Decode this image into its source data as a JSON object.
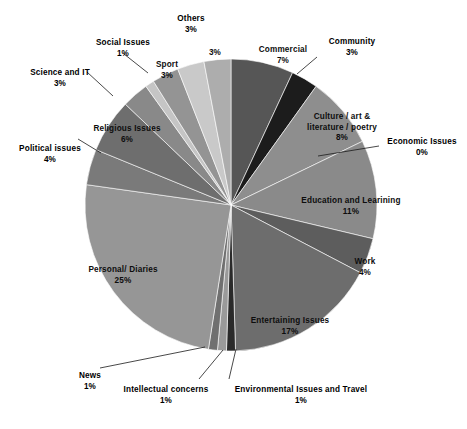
{
  "chart_data": {
    "type": "pie",
    "title": "",
    "xlabel": "",
    "ylabel": "",
    "legend_position": "none",
    "grid": false,
    "labels_show_percent": true,
    "categories": [
      "Commercial",
      "Community",
      "Culture / art & literature / poetry",
      "Economic Issues",
      "Education and Learining",
      "Work",
      "Entertaining Issues",
      "Environmental Issues and Travel",
      "Intellectual concerns",
      "News",
      "Personal/ Diaries",
      "Political issues",
      "Religious Issues",
      "Science and IT",
      "Social Issues",
      "Sport",
      "",
      "Others"
    ],
    "values": [
      7,
      3,
      8,
      0,
      11,
      4,
      17,
      1,
      1,
      1,
      25,
      4,
      6,
      3,
      1,
      3,
      3,
      3
    ],
    "unit": "%",
    "slices": [
      {
        "label": "Commercial",
        "value": 7,
        "percent": "7%",
        "color": "#565656",
        "label_x": 252,
        "label_y": 45,
        "label_w": 62,
        "placement": "inside"
      },
      {
        "label": "Community",
        "value": 3,
        "percent": "3%",
        "color": "#1c1c1c",
        "label_x": 315,
        "label_y": 37,
        "label_w": 74,
        "placement": "outside"
      },
      {
        "label": "Culture / art &\nliterature / poetry",
        "value": 8,
        "percent": "8%",
        "color": "#8e8e8e",
        "label_x": 300,
        "label_y": 112,
        "label_w": 84,
        "placement": "inside"
      },
      {
        "label": "Economic Issues",
        "value": 0,
        "percent": "0%",
        "color": "#7d7d7d",
        "label_x": 383,
        "label_y": 137,
        "label_w": 78,
        "placement": "outside"
      },
      {
        "label": "Education and Learining",
        "value": 11,
        "percent": "11%",
        "color": "#8a8a8a",
        "label_x": 296,
        "label_y": 196,
        "label_w": 110,
        "placement": "inside"
      },
      {
        "label": "Work",
        "value": 4,
        "percent": "4%",
        "color": "#5d5d5d",
        "label_x": 345,
        "label_y": 257,
        "label_w": 40,
        "placement": "inside"
      },
      {
        "label": "Entertaining Issues",
        "value": 17,
        "percent": "17%",
        "color": "#6d6d6d",
        "label_x": 244,
        "label_y": 316,
        "label_w": 92,
        "placement": "inside"
      },
      {
        "label": "Environmental Issues and Travel",
        "value": 1,
        "percent": "1%",
        "color": "#2a2a2a",
        "label_x": 226,
        "label_y": 385,
        "label_w": 150,
        "placement": "outside"
      },
      {
        "label": "Intellectual concerns",
        "value": 1,
        "percent": "1%",
        "color": "#9a9a9a",
        "label_x": 116,
        "label_y": 385,
        "label_w": 100,
        "placement": "outside"
      },
      {
        "label": "News",
        "value": 1,
        "percent": "1%",
        "color": "#707070",
        "label_x": 72,
        "label_y": 371,
        "label_w": 36,
        "placement": "outside"
      },
      {
        "label": "Personal/ Diaries",
        "value": 25,
        "percent": "25%",
        "color": "#969696",
        "label_x": 78,
        "label_y": 265,
        "label_w": 90,
        "placement": "inside"
      },
      {
        "label": "Political issues",
        "value": 4,
        "percent": "4%",
        "color": "#7a7a7a",
        "label_x": 14,
        "label_y": 144,
        "label_w": 72,
        "placement": "outside"
      },
      {
        "label": "Religious Issues",
        "value": 6,
        "percent": "6%",
        "color": "#6e6e6e",
        "label_x": 86,
        "label_y": 124,
        "label_w": 82,
        "placement": "inside"
      },
      {
        "label": "Science and IT",
        "value": 3,
        "percent": "3%",
        "color": "#898989",
        "label_x": 24,
        "label_y": 68,
        "label_w": 72,
        "placement": "outside"
      },
      {
        "label": "Social Issues",
        "value": 1,
        "percent": "1%",
        "color": "#c5c5c5",
        "label_x": 88,
        "label_y": 38,
        "label_w": 70,
        "placement": "outside"
      },
      {
        "label": "Sport",
        "value": 3,
        "percent": "3%",
        "color": "#949494",
        "label_x": 148,
        "label_y": 60,
        "label_w": 38,
        "placement": "inside"
      },
      {
        "label": "",
        "value": 3,
        "percent": "3%",
        "color": "#c9c9c9",
        "label_x": 197,
        "label_y": 48,
        "label_w": 36,
        "placement": "inside"
      },
      {
        "label": "Others",
        "value": 3,
        "percent": "3%",
        "color": "#adadad",
        "label_x": 160,
        "label_y": 14,
        "label_w": 62,
        "placement": "outside"
      }
    ],
    "geometry": {
      "center_x": 231,
      "center_y": 205,
      "radius": 146,
      "start_angle_deg": -90,
      "direction": "clockwise"
    },
    "leader_lines": [
      {
        "name": "community",
        "x1": 317,
        "y1": 57,
        "x2": 297,
        "y2": 74
      },
      {
        "name": "economic-issues",
        "x1": 379,
        "y1": 146,
        "x2": 318,
        "y2": 156
      },
      {
        "name": "environmental",
        "x1": 229,
        "y1": 379,
        "x2": 236,
        "y2": 349
      },
      {
        "name": "intellectual",
        "x1": 199,
        "y1": 379,
        "x2": 223,
        "y2": 350
      },
      {
        "name": "news",
        "x1": 100,
        "y1": 368,
        "x2": 205,
        "y2": 347
      },
      {
        "name": "political",
        "x1": 78,
        "y1": 139,
        "x2": 101,
        "y2": 153
      },
      {
        "name": "science-it",
        "x1": 87,
        "y1": 72,
        "x2": 113,
        "y2": 96
      },
      {
        "name": "social-issues",
        "x1": 124,
        "y1": 54,
        "x2": 148,
        "y2": 73
      }
    ]
  }
}
